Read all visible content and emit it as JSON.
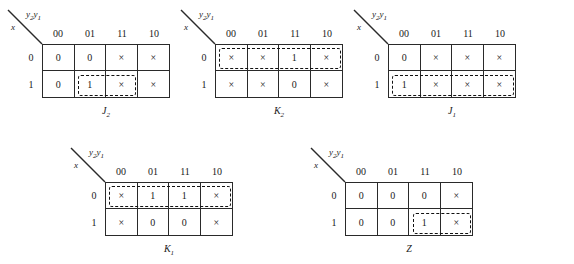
{
  "figure": {
    "type": "karnaugh-map-set",
    "map_count": 5,
    "column_variable": "y2y1",
    "row_variable": "x",
    "column_headers": [
      "00",
      "01",
      "11",
      "10"
    ],
    "row_headers": [
      "0",
      "1"
    ],
    "axis_label_col_main": "y",
    "axis_label_col_sub1": "2",
    "axis_label_col_mid": "y",
    "axis_label_col_sub2": "1",
    "axis_label_row": "x"
  },
  "maps": [
    {
      "id": "j2",
      "caption_main": "J",
      "caption_sub": "2",
      "x": 42,
      "y": 44,
      "rows": [
        [
          "0",
          "0",
          "×",
          "×"
        ],
        [
          "0",
          "1",
          "×",
          "×"
        ]
      ],
      "groups": [
        {
          "col_start": 1,
          "col_span": 2,
          "row_start": 1,
          "row_span": 1
        }
      ]
    },
    {
      "id": "k2",
      "caption_main": "K",
      "caption_sub": "2",
      "x": 215,
      "y": 44,
      "rows": [
        [
          "×",
          "×",
          "1",
          "×"
        ],
        [
          "×",
          "×",
          "0",
          "×"
        ]
      ],
      "groups": [
        {
          "col_start": 0,
          "col_span": 4,
          "row_start": 0,
          "row_span": 1
        }
      ]
    },
    {
      "id": "j1",
      "caption_main": "J",
      "caption_sub": "1",
      "x": 388,
      "y": 44,
      "rows": [
        [
          "0",
          "×",
          "×",
          "×"
        ],
        [
          "1",
          "×",
          "×",
          "×"
        ]
      ],
      "groups": [
        {
          "col_start": 0,
          "col_span": 4,
          "row_start": 1,
          "row_span": 1
        }
      ]
    },
    {
      "id": "k1",
      "caption_main": "K",
      "caption_sub": "1",
      "x": 105,
      "y": 182,
      "rows": [
        [
          "×",
          "1",
          "1",
          "×"
        ],
        [
          "×",
          "0",
          "0",
          "×"
        ]
      ],
      "groups": [
        {
          "col_start": 0,
          "col_span": 4,
          "row_start": 0,
          "row_span": 1
        }
      ]
    },
    {
      "id": "z",
      "caption_main": "Z",
      "caption_sub": "",
      "x": 345,
      "y": 182,
      "rows": [
        [
          "0",
          "0",
          "0",
          "×"
        ],
        [
          "0",
          "0",
          "1",
          "×"
        ]
      ],
      "groups": [
        {
          "col_start": 2,
          "col_span": 2,
          "row_start": 1,
          "row_span": 1
        }
      ]
    }
  ],
  "colors": {
    "grid_line": "#2a2a2a",
    "group_dash": "#111111",
    "background": "#ffffff",
    "text": "#1a1a1a"
  }
}
